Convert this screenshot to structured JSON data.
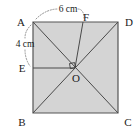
{
  "figure": {
    "shape": "square",
    "fill_color": "#d4d4d4",
    "outline_color": "#555555",
    "line_color": "#4a4a4a",
    "background_color": "#ffffff"
  },
  "vertices": {
    "a": "A",
    "b": "B",
    "c": "C",
    "d": "D",
    "e": "E",
    "f": "F",
    "o": "O"
  },
  "dimensions": {
    "top": "6 cm",
    "left": "4 cm"
  },
  "geometry": {
    "square": {
      "a": [
        33,
        22
      ],
      "d": [
        118,
        22
      ],
      "c": [
        118,
        113
      ],
      "b": [
        33,
        113
      ]
    },
    "points": {
      "o": [
        75,
        68
      ],
      "e": [
        33,
        68
      ],
      "f": [
        83,
        22
      ]
    },
    "segments": [
      {
        "name": "diagonal-ac",
        "from": [
          33,
          22
        ],
        "to": [
          118,
          113
        ]
      },
      {
        "name": "diagonal-bd",
        "from": [
          33,
          113
        ],
        "to": [
          118,
          22
        ]
      },
      {
        "name": "segment-eo",
        "from": [
          33,
          68
        ],
        "to": [
          75,
          68
        ]
      },
      {
        "name": "segment-fo",
        "from": [
          83,
          22
        ],
        "to": [
          75,
          68
        ]
      }
    ]
  }
}
